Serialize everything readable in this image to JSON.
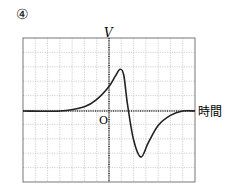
{
  "figure_label": "④",
  "axes": {
    "y_label": "V",
    "x_label": "時間",
    "origin_label": "O"
  },
  "chart_data": {
    "type": "line",
    "title": "",
    "xlabel": "時間",
    "ylabel": "V",
    "grid": true,
    "grid_divisions": {
      "x": 14,
      "y": 10
    },
    "origin": "O",
    "x": [
      -8,
      -4,
      -2,
      -1,
      0,
      0.5,
      0.9,
      1.2,
      1.5,
      2.0,
      2.6,
      3.2,
      4,
      5,
      6,
      7
    ],
    "values": [
      0,
      0,
      0.3,
      0.8,
      1.7,
      2.4,
      2.9,
      2.5,
      0.5,
      -2.0,
      -3.2,
      -2.2,
      -1.0,
      -0.3,
      0,
      0
    ],
    "peak": {
      "x": 0.9,
      "y": 2.9
    },
    "trough": {
      "x": 2.6,
      "y": -3.2
    }
  }
}
